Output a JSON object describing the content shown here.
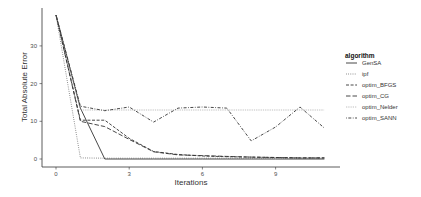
{
  "chart_data": {
    "type": "line",
    "title": "",
    "xlabel": "Iterations",
    "ylabel": "Total Absolute Error",
    "x": [
      0,
      1,
      2,
      3,
      4,
      5,
      6,
      7,
      8,
      9,
      10,
      11
    ],
    "xticks": [
      0,
      3,
      6,
      9
    ],
    "yticks": [
      0,
      10,
      20,
      30
    ],
    "xlim": [
      -0.5,
      11.5
    ],
    "ylim": [
      -1,
      39.5
    ],
    "grid": false,
    "legend_position": "right",
    "legend_title": "algorithm",
    "series": [
      {
        "name": "GenSA",
        "linestyle": "solid",
        "values": [
          38.2,
          13.5,
          0,
          0,
          0,
          0,
          0,
          0,
          0,
          0,
          0,
          0
        ]
      },
      {
        "name": "ipf",
        "linestyle": "dotted",
        "values": [
          38.2,
          0.3,
          0.2,
          0.2,
          0.2,
          0.2,
          0.2,
          0.2,
          0.2,
          0.2,
          0.2,
          0.2
        ]
      },
      {
        "name": "optim_BFGS",
        "linestyle": "dashed",
        "values": [
          38.2,
          10.3,
          10.3,
          5.5,
          2.0,
          1.2,
          0.8,
          0.6,
          0.5,
          0.4,
          0.3,
          0.3
        ]
      },
      {
        "name": "optim_CG",
        "linestyle": "longdash",
        "values": [
          38.2,
          10.0,
          8.6,
          5.2,
          1.9,
          1.1,
          0.9,
          0.7,
          0.5,
          0.4,
          0.3,
          0.3
        ]
      },
      {
        "name": "optim_Nelder",
        "linestyle": "dotted-light",
        "values": [
          38.2,
          13.0,
          13.0,
          13.0,
          13.0,
          13.0,
          13.0,
          13.0,
          13.0,
          13.0,
          13.0,
          13.0
        ]
      },
      {
        "name": "optim_SANN",
        "linestyle": "dotdash",
        "values": [
          38.2,
          14.0,
          12.8,
          13.8,
          9.8,
          13.5,
          13.8,
          13.5,
          4.8,
          8.5,
          13.8,
          8.2
        ]
      }
    ]
  },
  "axes": {
    "x_title": "Iterations",
    "y_title": "Total Absolute Error",
    "x_tick_labels": [
      "0",
      "3",
      "6",
      "9"
    ],
    "y_tick_labels": [
      "0",
      "10",
      "20",
      "30"
    ]
  },
  "legend": {
    "title": "algorithm",
    "items": [
      "GenSA",
      "ipf",
      "optim_BFGS",
      "optim_CG",
      "optim_Nelder",
      "optim_SANN"
    ]
  },
  "colors": {
    "line": "#333333",
    "light_line": "#9a9a9a",
    "axis": "#333333"
  }
}
